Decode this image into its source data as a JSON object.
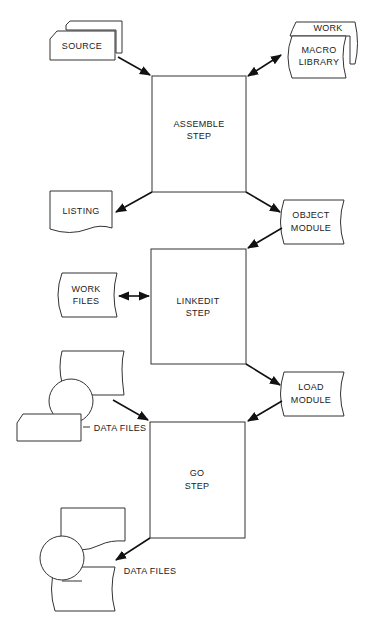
{
  "diagram": {
    "type": "flowchart",
    "steps": [
      {
        "id": "assemble",
        "lines": [
          "ASSEMBLE",
          "STEP"
        ]
      },
      {
        "id": "linkedit",
        "lines": [
          "LINKEDIT",
          "STEP"
        ]
      },
      {
        "id": "go",
        "lines": [
          "GO",
          "STEP"
        ]
      }
    ],
    "datasets": {
      "source": {
        "lines": [
          "SOURCE"
        ],
        "shape": "card-deck"
      },
      "macro_library": {
        "lines": [
          "MACRO",
          "LIBRARY"
        ],
        "shape": "stored-data"
      },
      "work_back": {
        "lines": [
          "WORK"
        ],
        "shape": "stored-data"
      },
      "listing": {
        "lines": [
          "LISTING"
        ],
        "shape": "document"
      },
      "object_module": {
        "lines": [
          "OBJECT",
          "MODULE"
        ],
        "shape": "stored-data"
      },
      "work_files": {
        "lines": [
          "WORK",
          "FILES"
        ],
        "shape": "stored-data"
      },
      "load_module": {
        "lines": [
          "LOAD",
          "MODULE"
        ],
        "shape": "stored-data"
      },
      "data_files_in": {
        "label": "DATA FILES",
        "shape": "document+tape+card"
      },
      "data_files_out": {
        "label": "DATA FILES",
        "shape": "document+tape+stored-data"
      }
    },
    "edges": [
      {
        "from": "source",
        "to": "assemble",
        "direction": "one-way"
      },
      {
        "from": "macro_library",
        "to": "assemble",
        "direction": "two-way"
      },
      {
        "from": "assemble",
        "to": "listing",
        "direction": "one-way"
      },
      {
        "from": "assemble",
        "to": "object_module",
        "direction": "one-way"
      },
      {
        "from": "object_module",
        "to": "linkedit",
        "direction": "one-way"
      },
      {
        "from": "work_files",
        "to": "linkedit",
        "direction": "two-way"
      },
      {
        "from": "linkedit",
        "to": "load_module",
        "direction": "one-way"
      },
      {
        "from": "load_module",
        "to": "go",
        "direction": "one-way"
      },
      {
        "from": "data_files_in",
        "to": "go",
        "direction": "one-way"
      },
      {
        "from": "go",
        "to": "data_files_out",
        "direction": "one-way"
      }
    ]
  }
}
